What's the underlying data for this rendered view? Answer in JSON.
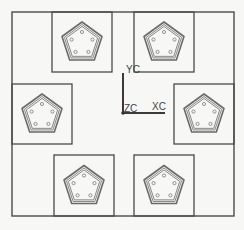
{
  "canvas": {
    "background": "#f7f7f5",
    "line_color": "#4a4a4a",
    "pad_color": "#6a6a6a"
  },
  "frame": {
    "x": 12,
    "y": 12,
    "w": 222,
    "h": 204
  },
  "boxes": [
    {
      "name": "top-left",
      "x": 52,
      "y": 12,
      "w": 60,
      "h": 60
    },
    {
      "name": "top-right",
      "x": 134,
      "y": 12,
      "w": 60,
      "h": 60
    },
    {
      "name": "left",
      "x": 12,
      "y": 84,
      "w": 60,
      "h": 60
    },
    {
      "name": "right",
      "x": 174,
      "y": 84,
      "w": 60,
      "h": 60
    },
    {
      "name": "bottom-left",
      "x": 54,
      "y": 155,
      "w": 60,
      "h": 61
    },
    {
      "name": "bottom-right",
      "x": 134,
      "y": 155,
      "w": 60,
      "h": 61
    }
  ],
  "pentagon": {
    "holes": 5
  },
  "axes": {
    "origin": {
      "x": 123,
      "y": 113
    },
    "labels": {
      "y": "YC",
      "x": "XC",
      "z": "ZC"
    }
  }
}
